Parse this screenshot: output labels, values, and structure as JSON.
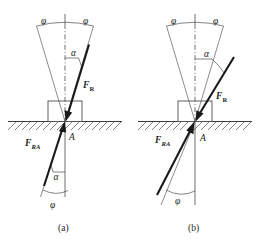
{
  "figure": {
    "background_color": "#ffffff",
    "line_color": "#4d4d4d",
    "force_color": "#1a1a1a",
    "panels": [
      {
        "id": "a",
        "caption": "(a)",
        "description": "Resultant force inside the friction cone",
        "labels": {
          "phi_left": "φ",
          "phi_right": "φ",
          "alpha_upper": "α",
          "alpha_lower": "α",
          "phi_lower": "φ",
          "point": "A",
          "force_resultant_main": "F",
          "force_resultant_sub": "R",
          "force_reaction_main": "F",
          "force_reaction_sub": "RA"
        }
      },
      {
        "id": "b",
        "caption": "(b)",
        "description": "Resultant force outside the friction cone",
        "labels": {
          "phi_left": "φ",
          "phi_right": "φ",
          "alpha_upper": "α",
          "phi_lower": "φ",
          "point": "A",
          "force_resultant_main": "F",
          "force_resultant_sub": "R",
          "force_reaction_main": "F",
          "force_reaction_sub": "RA"
        }
      }
    ]
  }
}
